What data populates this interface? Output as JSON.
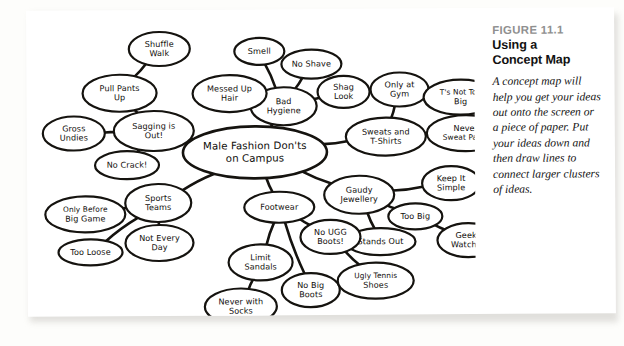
{
  "figure": {
    "number_label": "FIGURE 11.1",
    "title_line1": "Using a",
    "title_line2": "Concept Map",
    "body": "A concept map will help you get your ideas out onto the screen or a piece of paper. Put your ideas down and then draw lines to connect larger clusters of ideas."
  },
  "concept_map": {
    "center_id": "center",
    "nodes": [
      {
        "id": "center",
        "lines": [
          "Male Fashion Don'ts",
          "on Campus"
        ],
        "cx": 228,
        "cy": 143,
        "rx": 72,
        "ry": 26,
        "size": "center"
      },
      {
        "id": "sagging",
        "lines": [
          "Sagging is",
          "Out!"
        ],
        "cx": 127,
        "cy": 121,
        "rx": 40,
        "ry": 20,
        "size": "normal"
      },
      {
        "id": "pullpants",
        "lines": [
          "Pull Pants",
          "Up"
        ],
        "cx": 93,
        "cy": 83,
        "rx": 37,
        "ry": 18.5,
        "size": "normal"
      },
      {
        "id": "shuffle",
        "lines": [
          "Shuffle",
          "Walk"
        ],
        "cx": 133,
        "cy": 39,
        "rx": 30.5,
        "ry": 17,
        "size": "normal"
      },
      {
        "id": "gross",
        "lines": [
          "Gross",
          "Undies"
        ],
        "cx": 47,
        "cy": 123,
        "rx": 31,
        "ry": 17,
        "size": "normal"
      },
      {
        "id": "nocrack",
        "lines": [
          "No Crack!"
        ],
        "cx": 100,
        "cy": 155,
        "rx": 32,
        "ry": 14,
        "size": "normal"
      },
      {
        "id": "hygiene",
        "lines": [
          "Bad",
          "Hygiene"
        ],
        "cx": 257,
        "cy": 97,
        "rx": 33,
        "ry": 19,
        "size": "normal"
      },
      {
        "id": "smell",
        "lines": [
          "Smell"
        ],
        "cx": 233,
        "cy": 42,
        "rx": 25,
        "ry": 13.5,
        "size": "normal"
      },
      {
        "id": "noshave",
        "lines": [
          "No Shave"
        ],
        "cx": 285,
        "cy": 55,
        "rx": 30,
        "ry": 14.5,
        "size": "normal"
      },
      {
        "id": "shag",
        "lines": [
          "Shag",
          "Look"
        ],
        "cx": 317,
        "cy": 83,
        "rx": 26,
        "ry": 16,
        "size": "normal"
      },
      {
        "id": "messedup",
        "lines": [
          "Messed Up",
          "Hair"
        ],
        "cx": 203,
        "cy": 84,
        "rx": 37,
        "ry": 18.5,
        "size": "normal"
      },
      {
        "id": "sweats",
        "lines": [
          "Sweats and",
          "T-Shirts"
        ],
        "cx": 359,
        "cy": 128,
        "rx": 40,
        "ry": 19,
        "size": "normal"
      },
      {
        "id": "onlygym",
        "lines": [
          "Only at",
          "Gym"
        ],
        "cx": 373,
        "cy": 81,
        "rx": 29,
        "ry": 17,
        "size": "normal"
      },
      {
        "id": "tsnottoobig",
        "lines": [
          "T's Not Too",
          "Big"
        ],
        "cx": 434,
        "cy": 89,
        "rx": 37,
        "ry": 17.5,
        "size": "normal"
      },
      {
        "id": "neversweat",
        "lines": [
          "Never",
          "Sweat Pants"
        ],
        "cx": 439,
        "cy": 125,
        "rx": 39,
        "ry": 18,
        "size": "normal"
      },
      {
        "id": "gaudy",
        "lines": [
          "Gaudy",
          "Jewellery"
        ],
        "cx": 332,
        "cy": 186,
        "rx": 35,
        "ry": 19,
        "size": "normal"
      },
      {
        "id": "keepsimple",
        "lines": [
          "Keep It",
          "Simple"
        ],
        "cx": 424,
        "cy": 175,
        "rx": 29,
        "ry": 17,
        "size": "normal"
      },
      {
        "id": "toobig",
        "lines": [
          "Too Big"
        ],
        "cx": 388,
        "cy": 208,
        "rx": 27,
        "ry": 13,
        "size": "normal"
      },
      {
        "id": "standsout",
        "lines": [
          "Stands Out"
        ],
        "cx": 353,
        "cy": 233,
        "rx": 35,
        "ry": 13.5,
        "size": "normal"
      },
      {
        "id": "geeky",
        "lines": [
          "Geeky",
          "Watches"
        ],
        "cx": 441,
        "cy": 232,
        "rx": 31,
        "ry": 17,
        "size": "normal"
      },
      {
        "id": "sports",
        "lines": [
          "Sports",
          "Teams"
        ],
        "cx": 131,
        "cy": 193,
        "rx": 33,
        "ry": 19,
        "size": "normal"
      },
      {
        "id": "onlybefore",
        "lines": [
          "Only Before",
          "Big Game"
        ],
        "cx": 58,
        "cy": 204,
        "rx": 40,
        "ry": 18,
        "size": "normal"
      },
      {
        "id": "tooloose",
        "lines": [
          "Too Loose"
        ],
        "cx": 63,
        "cy": 242,
        "rx": 32,
        "ry": 13,
        "size": "normal"
      },
      {
        "id": "noteveryday",
        "lines": [
          "Not Every",
          "Day"
        ],
        "cx": 132,
        "cy": 233,
        "rx": 34,
        "ry": 18,
        "size": "normal"
      },
      {
        "id": "footwear",
        "lines": [
          "Footwear"
        ],
        "cx": 252,
        "cy": 198,
        "rx": 35,
        "ry": 15.5,
        "size": "normal"
      },
      {
        "id": "limitsandals",
        "lines": [
          "Limit",
          "Sandals"
        ],
        "cx": 233,
        "cy": 253,
        "rx": 32,
        "ry": 18,
        "size": "normal"
      },
      {
        "id": "neversocks",
        "lines": [
          "Never with",
          "Socks"
        ],
        "cx": 213,
        "cy": 297,
        "rx": 36,
        "ry": 18,
        "size": "normal"
      },
      {
        "id": "nobigboots",
        "lines": [
          "No Big",
          "Boots"
        ],
        "cx": 283,
        "cy": 281,
        "rx": 29,
        "ry": 17,
        "size": "normal"
      },
      {
        "id": "nouggboots",
        "lines": [
          "No UGG",
          "Boots!"
        ],
        "cx": 303,
        "cy": 228,
        "rx": 30,
        "ry": 17,
        "size": "normal"
      },
      {
        "id": "uglytennis",
        "lines": [
          "Ugly Tennis",
          "Shoes"
        ],
        "cx": 348,
        "cy": 272,
        "rx": 38,
        "ry": 18,
        "size": "normal"
      }
    ],
    "edges": [
      [
        "center",
        "sagging"
      ],
      [
        "center",
        "hygiene"
      ],
      [
        "center",
        "sweats"
      ],
      [
        "center",
        "gaudy"
      ],
      [
        "center",
        "sports"
      ],
      [
        "center",
        "footwear"
      ],
      [
        "sagging",
        "pullpants"
      ],
      [
        "sagging",
        "gross"
      ],
      [
        "sagging",
        "nocrack"
      ],
      [
        "pullpants",
        "shuffle"
      ],
      [
        "hygiene",
        "smell"
      ],
      [
        "hygiene",
        "noshave"
      ],
      [
        "hygiene",
        "shag"
      ],
      [
        "hygiene",
        "messedup"
      ],
      [
        "sweats",
        "onlygym"
      ],
      [
        "sweats",
        "neversweat"
      ],
      [
        "onlygym",
        "tsnottoobig"
      ],
      [
        "gaudy",
        "keepsimple"
      ],
      [
        "gaudy",
        "standsout"
      ],
      [
        "gaudy",
        "toobig"
      ],
      [
        "toobig",
        "geeky"
      ],
      [
        "sports",
        "onlybefore"
      ],
      [
        "sports",
        "tooloose"
      ],
      [
        "sports",
        "noteveryday"
      ],
      [
        "footwear",
        "limitsandals"
      ],
      [
        "footwear",
        "nobigboots"
      ],
      [
        "footwear",
        "nouggboots"
      ],
      [
        "limitsandals",
        "neversocks"
      ],
      [
        "nouggboots",
        "uglytennis"
      ]
    ]
  }
}
